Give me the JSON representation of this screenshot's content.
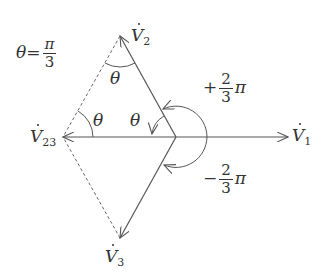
{
  "diagram": {
    "type": "phasor-diagram",
    "theta_definition": {
      "symbol": "θ",
      "equals": "=",
      "numerator": "π",
      "denominator": "3"
    },
    "phasors": [
      {
        "id": "V1",
        "base": "V",
        "subscript": "1",
        "direction_deg": 0,
        "style": "solid"
      },
      {
        "id": "V2",
        "base": "V",
        "subscript": "2",
        "direction_deg": 120,
        "style": "solid"
      },
      {
        "id": "V3",
        "base": "V",
        "subscript": "3",
        "direction_deg": -120,
        "style": "solid"
      },
      {
        "id": "V23",
        "base": "V",
        "subscript": "23",
        "direction_deg": 180,
        "style": "solid"
      }
    ],
    "dashed_lines": [
      "V2-tip to V23-tip",
      "V3-tip to V23-tip"
    ],
    "angle_labels": {
      "theta_top": "θ",
      "theta_left": "θ",
      "theta_center": "θ",
      "positive_angle": {
        "sign": "+",
        "numerator": "2",
        "denominator": "3",
        "suffix": "π"
      },
      "negative_angle": {
        "sign": "−",
        "numerator": "2",
        "denominator": "3",
        "suffix": "π"
      }
    },
    "colors": {
      "line": "#555555",
      "text": "#333333",
      "background": "#ffffff"
    }
  }
}
